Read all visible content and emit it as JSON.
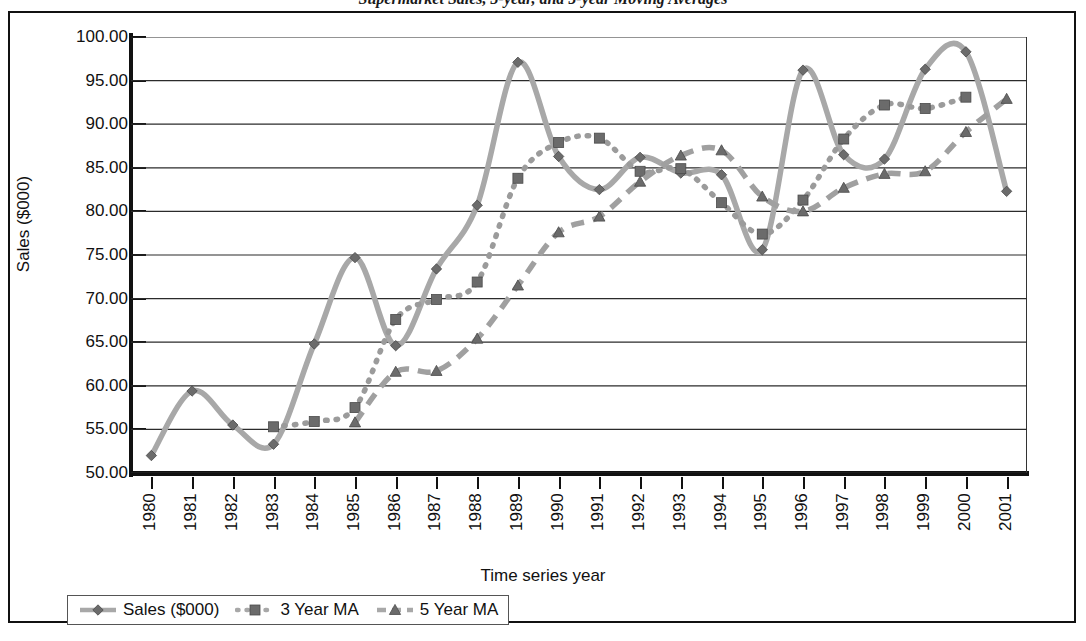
{
  "title": "Supermarket Sales, 3-year, and 5-year Moving Averages",
  "axes": {
    "y_title": "Sales ($000)",
    "x_title": "Time series year",
    "y_ticks": [
      "100.00",
      "95.00",
      "90.00",
      "85.00",
      "80.00",
      "75.00",
      "70.00",
      "65.00",
      "60.00",
      "55.00",
      "50.00"
    ],
    "x_ticks": [
      "1980",
      "1981",
      "1982",
      "1983",
      "1984",
      "1985",
      "1986",
      "1987",
      "1988",
      "1989",
      "1990",
      "1991",
      "1992",
      "1993",
      "1994",
      "1995",
      "1996",
      "1997",
      "1998",
      "1999",
      "2000",
      "2001"
    ]
  },
  "legend": {
    "items": [
      {
        "label": "Sales ($000)",
        "marker": "diamond",
        "line": "solid",
        "color": "#8c8c8c"
      },
      {
        "label": "3 Year MA",
        "marker": "square",
        "line": "dotted",
        "color": "#999999"
      },
      {
        "label": "5 Year MA",
        "marker": "triangle",
        "line": "dashed",
        "color": "#999999"
      }
    ]
  },
  "chart_data": {
    "type": "line",
    "title": "Supermarket Sales, 3-year, and 5-year Moving Averages",
    "xlabel": "Time series year",
    "ylabel": "Sales ($000)",
    "ylim": [
      50,
      100
    ],
    "ytick_step": 5,
    "grid": "horizontal",
    "legend_position": "bottom",
    "x": [
      1980,
      1981,
      1982,
      1983,
      1984,
      1985,
      1986,
      1987,
      1988,
      1989,
      1990,
      1991,
      1992,
      1993,
      1994,
      1995,
      1996,
      1997,
      1998,
      1999,
      2000,
      2001
    ],
    "series": [
      {
        "name": "Sales ($000)",
        "marker": "diamond",
        "line": "solid",
        "color": "#8c8c8c",
        "values": [
          52.0,
          59.4,
          55.5,
          53.3,
          64.8,
          74.7,
          64.6,
          73.4,
          80.7,
          97.1,
          86.3,
          82.5,
          86.2,
          84.4,
          84.2,
          75.6,
          96.2,
          86.5,
          86.0,
          96.3,
          98.3,
          82.3
        ]
      },
      {
        "name": "3 Year MA",
        "marker": "square",
        "line": "dotted",
        "color": "#999999",
        "values": [
          null,
          null,
          null,
          55.3,
          55.9,
          57.5,
          67.6,
          69.9,
          71.9,
          83.8,
          87.9,
          88.4,
          84.6,
          84.9,
          81.0,
          77.4,
          81.3,
          88.3,
          92.2,
          91.8,
          93.1,
          null
        ]
      },
      {
        "name": "5 Year MA",
        "marker": "triangle",
        "line": "dashed",
        "color": "#999999",
        "values": [
          null,
          null,
          null,
          null,
          null,
          55.8,
          61.6,
          61.7,
          65.4,
          71.5,
          77.6,
          79.4,
          83.4,
          86.4,
          87.0,
          81.7,
          80.0,
          82.7,
          84.3,
          84.6,
          89.1,
          92.9
        ]
      }
    ]
  }
}
